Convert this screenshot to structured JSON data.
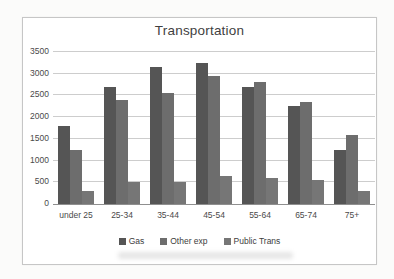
{
  "chart_data": {
    "type": "bar",
    "title": "Transportation",
    "categories": [
      "under 25",
      "25-34",
      "35-44",
      "45-54",
      "55-64",
      "65-74",
      "75+"
    ],
    "series": [
      {
        "name": "Gas",
        "color": "#555555",
        "values": [
          1800,
          2700,
          3150,
          3250,
          2700,
          2250,
          1250
        ]
      },
      {
        "name": "Other exp",
        "color": "#6d6d6d",
        "values": [
          1250,
          2400,
          2550,
          2950,
          2800,
          2350,
          1600
        ]
      },
      {
        "name": "Public Trans",
        "color": "#767676",
        "values": [
          300,
          500,
          500,
          650,
          600,
          550,
          300
        ]
      }
    ],
    "xlabel": "",
    "ylabel": "",
    "ylim": [
      0,
      3500
    ],
    "yticks": [
      0,
      500,
      1000,
      1500,
      2000,
      2500,
      3000,
      3500
    ],
    "grid": true,
    "legend_position": "bottom"
  },
  "colors": {
    "grid": "#cdcdcd",
    "axis_line": "#8f8f8f",
    "text": "#4a4a4a",
    "frame_border": "#c6c6c6",
    "background": "#ffffff"
  }
}
